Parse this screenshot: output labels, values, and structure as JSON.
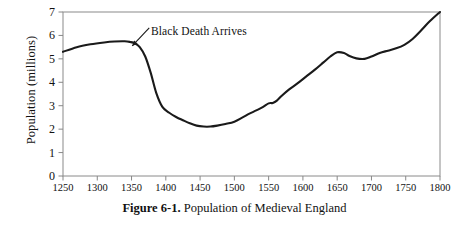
{
  "caption": {
    "number": "Figure 6-1.",
    "text": "Population of Medieval England"
  },
  "chart_data": {
    "type": "line",
    "title": "Population of Medieval England",
    "xlabel": "",
    "ylabel": "Population (millions)",
    "xlim": [
      1250,
      1800
    ],
    "ylim": [
      0,
      7
    ],
    "grid": false,
    "legend": "none",
    "line_color": "#1a1a1a",
    "frame_color": "#888888",
    "xticks": [
      1250,
      1300,
      1350,
      1400,
      1450,
      1500,
      1550,
      1600,
      1650,
      1700,
      1750,
      1800
    ],
    "xtick_labels": [
      "1250",
      "1300",
      "1350",
      "1400",
      "1450",
      "1500",
      "1550",
      "1600",
      "1650",
      "1700",
      "1750",
      "1800"
    ],
    "yticks": [
      0,
      1,
      2,
      3,
      4,
      5,
      6,
      7
    ],
    "ytick_labels": [
      "0",
      "1",
      "2",
      "3",
      "4",
      "5",
      "6",
      "7"
    ],
    "annotations": [
      {
        "text": "Black Death Arrives",
        "label_x": 1400,
        "label_y": 6.3,
        "arrow_tip_x": 1351,
        "arrow_tip_y": 5.55
      }
    ],
    "series": [
      {
        "name": "Population of England",
        "x": [
          1250,
          1270,
          1290,
          1310,
          1325,
          1340,
          1348,
          1355,
          1362,
          1370,
          1378,
          1386,
          1395,
          1405,
          1415,
          1425,
          1435,
          1445,
          1455,
          1465,
          1475,
          1487,
          1500,
          1512,
          1522,
          1532,
          1542,
          1550,
          1556,
          1562,
          1570,
          1580,
          1592,
          1605,
          1618,
          1630,
          1640,
          1650,
          1660,
          1668,
          1678,
          1690,
          1700,
          1712,
          1724,
          1736,
          1748,
          1760,
          1772,
          1785,
          1800
        ],
        "y": [
          5.3,
          5.5,
          5.62,
          5.7,
          5.74,
          5.75,
          5.72,
          5.66,
          5.5,
          5.1,
          4.4,
          3.55,
          2.95,
          2.7,
          2.52,
          2.38,
          2.25,
          2.15,
          2.11,
          2.11,
          2.15,
          2.22,
          2.32,
          2.5,
          2.66,
          2.8,
          2.95,
          3.1,
          3.12,
          3.22,
          3.45,
          3.7,
          3.95,
          4.25,
          4.55,
          4.85,
          5.1,
          5.28,
          5.25,
          5.12,
          5.02,
          5.0,
          5.1,
          5.25,
          5.35,
          5.45,
          5.6,
          5.85,
          6.2,
          6.6,
          7.0
        ]
      }
    ]
  }
}
